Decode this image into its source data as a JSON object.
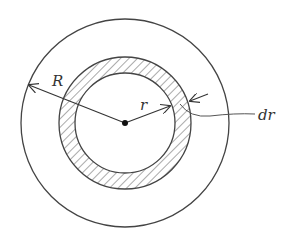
{
  "diagram": {
    "labels": {
      "outer_radius": "R",
      "inner_radius": "r",
      "thickness": "dr"
    },
    "geometry": {
      "center": [
        125,
        123
      ],
      "outer_circle_radius": 104,
      "annulus_outer_radius": 66,
      "annulus_inner_radius": 50
    },
    "colors": {
      "stroke": "#444444",
      "hatch": "#555555",
      "background": "#ffffff"
    }
  }
}
